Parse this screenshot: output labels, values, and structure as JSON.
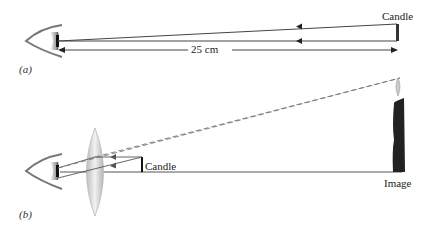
{
  "panel_a": {
    "label": "(a)",
    "object_label": "Candle",
    "distance_label": "25 cm"
  },
  "panel_b": {
    "label": "(b)",
    "object_label": "Candle",
    "image_label": "Image"
  },
  "colors": {
    "ray": "#444444",
    "dashed_ray": "#777777",
    "candle": "#222222",
    "lens": "#d8d8d8"
  }
}
